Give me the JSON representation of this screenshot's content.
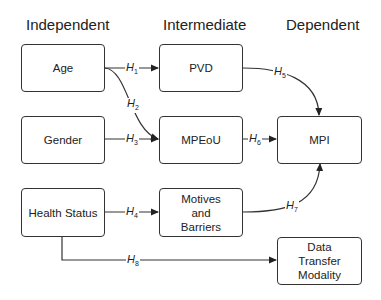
{
  "columns": {
    "independent": "Independent",
    "intermediate": "Intermediate",
    "dependent": "Dependent"
  },
  "nodes": {
    "age": "Age",
    "gender": "Gender",
    "health_status": "Health Status",
    "pvd": "PVD",
    "mpeou": "MPEoU",
    "motives_barriers": "Motives and Barriers",
    "mpi": "MPI",
    "data_transfer_modality": "Data Transfer Modality"
  },
  "hypotheses": [
    {
      "id": "H",
      "sub": "1",
      "from": "Age",
      "to": "PVD"
    },
    {
      "id": "H",
      "sub": "2",
      "from": "Age",
      "to": "MPEoU"
    },
    {
      "id": "H",
      "sub": "3",
      "from": "Gender",
      "to": "MPEoU"
    },
    {
      "id": "H",
      "sub": "4",
      "from": "Health Status",
      "to": "Motives and Barriers"
    },
    {
      "id": "H",
      "sub": "5",
      "from": "PVD",
      "to": "MPI"
    },
    {
      "id": "H",
      "sub": "6",
      "from": "MPEoU",
      "to": "MPI"
    },
    {
      "id": "H",
      "sub": "7",
      "from": "Motives and Barriers",
      "to": "MPI"
    },
    {
      "id": "H",
      "sub": "8",
      "from": "Health Status",
      "to": "Data Transfer Modality"
    }
  ]
}
